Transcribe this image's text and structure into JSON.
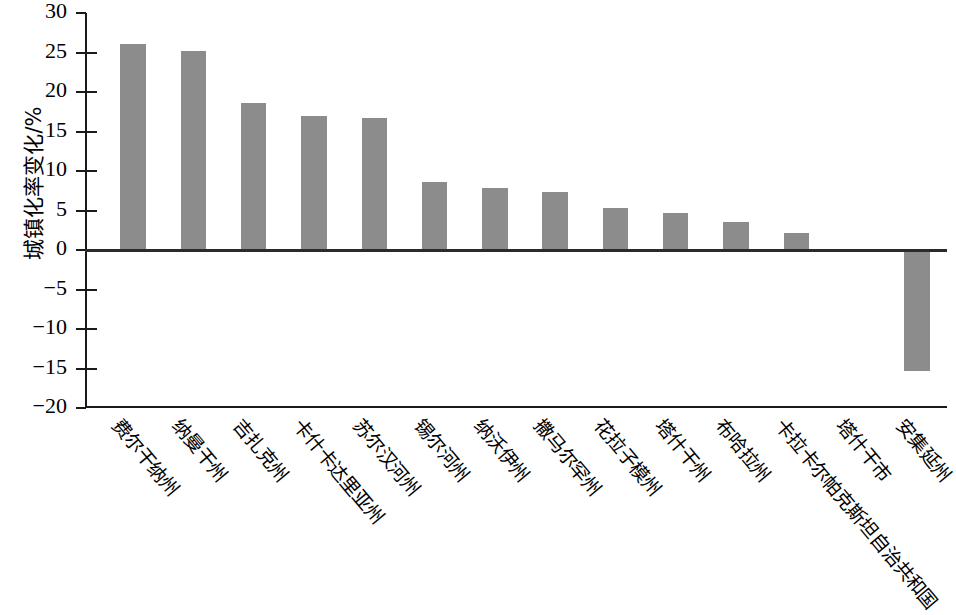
{
  "chart_data": {
    "type": "bar",
    "title": "",
    "subtitle": "",
    "xlabel": "",
    "ylabel": "城镇化率变化/%",
    "ylim": [
      -20,
      30
    ],
    "ytick_step": 5,
    "yticks": [
      30,
      25,
      20,
      15,
      10,
      5,
      0,
      -5,
      -10,
      -15,
      -20
    ],
    "ytick_labels": [
      "30",
      "25",
      "20",
      "15",
      "10",
      "5",
      "0",
      "−5",
      "−10",
      "−15",
      "−20"
    ],
    "grid": false,
    "legend": "none",
    "bar_color": "#8c8c8c",
    "axis_color": "#1a1a1a",
    "categories": [
      "费尔干纳州",
      "纳曼干州",
      "吉扎克州",
      "卡什卡达里亚州",
      "苏尔汉河州",
      "锡尔河州",
      "纳沃伊州",
      "撒马尔罕州",
      "花拉子模州",
      "塔什干州",
      "布哈拉州",
      "卡拉卡尔帕克斯坦自治共和国",
      "塔什干市",
      "安集延州"
    ],
    "values": [
      26.1,
      25.2,
      18.6,
      17.0,
      16.7,
      8.6,
      7.9,
      7.3,
      5.3,
      4.7,
      3.6,
      2.2,
      0.0,
      -15.3
    ]
  }
}
